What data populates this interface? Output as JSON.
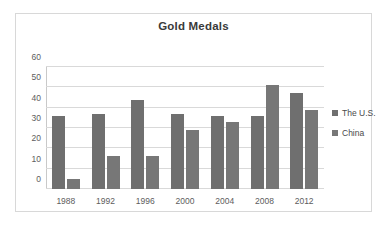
{
  "chart_data": {
    "type": "bar",
    "title": "Gold Medals",
    "xlabel": "",
    "ylabel": "",
    "categories": [
      "1988",
      "1992",
      "1996",
      "2000",
      "2004",
      "2008",
      "2012"
    ],
    "series": [
      {
        "name": "The U.S.",
        "color": "#6f6f6f",
        "values": [
          36,
          37,
          44,
          37,
          36,
          36,
          47
        ]
      },
      {
        "name": "China",
        "color": "#777777",
        "values": [
          5,
          16,
          16,
          29,
          33,
          51,
          39
        ]
      }
    ],
    "ylim": [
      0,
      60
    ],
    "yticks": [
      0,
      10,
      20,
      30,
      40,
      50,
      60
    ],
    "ytick_labels": [
      "0",
      "10",
      "20",
      "30",
      "40",
      "50",
      "60"
    ],
    "grid": true,
    "legend_position": "right",
    "plot_background": "#ffffff",
    "gridline_color": "#d9d9d9",
    "border_color": "#d8d8d8"
  }
}
